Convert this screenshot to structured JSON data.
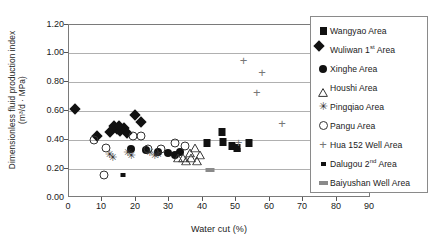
{
  "chart_data": {
    "type": "scatter",
    "title": "",
    "xlabel": "Water cut (%)",
    "ylabel_line1": "Dimensionless fluid production index",
    "ylabel_line2": "(m³/d · MPa)",
    "xlim": [
      0,
      90
    ],
    "ylim": [
      0.0,
      1.2
    ],
    "xticks": [
      "0",
      "10",
      "20",
      "30",
      "40",
      "50",
      "60",
      "70",
      "80",
      "90"
    ],
    "yticks": [
      "0.00",
      "0.20",
      "0.40",
      "0.60",
      "0.80",
      "1.00",
      "1.20"
    ],
    "grid": "horizontal",
    "legend_position": "right-inside",
    "series": [
      {
        "name": "Wangyao Area",
        "marker": "filled-square",
        "color": "#111111",
        "points": [
          [
            45.5,
            0.46
          ],
          [
            46.0,
            0.39
          ],
          [
            48.5,
            0.36
          ],
          [
            50.0,
            0.35
          ],
          [
            53.5,
            0.38
          ],
          [
            41.0,
            0.38
          ]
        ]
      },
      {
        "name": "Wuliwan 1st Area",
        "marker": "filled-diamond",
        "color": "#111111",
        "points": [
          [
            3.0,
            0.59
          ],
          [
            9.5,
            0.4
          ],
          [
            13.5,
            0.43
          ],
          [
            15.5,
            0.45
          ],
          [
            16.5,
            0.44
          ],
          [
            17.5,
            0.46
          ],
          [
            18.5,
            0.42
          ],
          [
            21.0,
            0.55
          ],
          [
            22.5,
            0.5
          ],
          [
            14.5,
            0.47
          ],
          [
            16.0,
            0.47
          ]
        ]
      },
      {
        "name": "Xinghe Area",
        "marker": "filled-circle",
        "color": "#111111",
        "points": [
          [
            18.5,
            0.34
          ],
          [
            23.0,
            0.33
          ],
          [
            26.5,
            0.32
          ],
          [
            29.5,
            0.31
          ],
          [
            31.5,
            0.3
          ],
          [
            33.0,
            0.32
          ]
        ]
      },
      {
        "name": "Houshi Area",
        "marker": "open-triangle",
        "color": "#333333",
        "points": [
          [
            34.0,
            0.31
          ],
          [
            35.0,
            0.29
          ],
          [
            36.0,
            0.35
          ],
          [
            36.5,
            0.31
          ],
          [
            37.5,
            0.38
          ],
          [
            38.0,
            0.29
          ],
          [
            39.0,
            0.33
          ],
          [
            32.5,
            0.31
          ]
        ]
      },
      {
        "name": "Pingqiao Area",
        "marker": "asterisk",
        "color": "#333333",
        "points": [
          [
            12.0,
            0.3
          ],
          [
            13.0,
            0.28
          ],
          [
            17.5,
            0.31
          ],
          [
            18.5,
            0.29
          ],
          [
            24.0,
            0.31
          ],
          [
            25.5,
            0.29
          ],
          [
            26.5,
            0.3
          ]
        ]
      },
      {
        "name": "Pangu Area",
        "marker": "open-circle",
        "color": "#333333",
        "points": [
          [
            7.5,
            0.4
          ],
          [
            11.0,
            0.35
          ],
          [
            19.0,
            0.43
          ],
          [
            21.5,
            0.43
          ],
          [
            23.5,
            0.34
          ],
          [
            27.5,
            0.34
          ],
          [
            31.5,
            0.38
          ],
          [
            34.5,
            0.36
          ],
          [
            10.5,
            0.16
          ]
        ]
      },
      {
        "name": "Hua 152 Well Area",
        "marker": "plus",
        "color": "#777777",
        "points": [
          [
            52.0,
            0.95
          ],
          [
            57.5,
            0.87
          ],
          [
            56.0,
            0.73
          ],
          [
            63.5,
            0.51
          ],
          [
            50.5,
            0.38
          ]
        ]
      },
      {
        "name": "Dalugou 2nd Area",
        "marker": "small-square",
        "color": "#111111",
        "points": [
          [
            16.0,
            0.16
          ],
          [
            50.5,
            0.33
          ]
        ]
      },
      {
        "name": "Baiyushan Well Area",
        "marker": "gray-bar",
        "color": "#8a8a8a",
        "points": [
          [
            42.0,
            0.195
          ]
        ]
      }
    ]
  },
  "legend": {
    "items": [
      {
        "label": "Wangyao Area",
        "marker": "filled-square-icon"
      },
      {
        "label": "Wuliwan 1",
        "sup": "st",
        "label2": " Area",
        "marker": "filled-diamond-icon"
      },
      {
        "label": "Xinghe Area",
        "marker": "filled-circle-icon"
      },
      {
        "label": "Houshi Area",
        "marker": "open-triangle-icon"
      },
      {
        "label": "Pingqiao Area",
        "marker": "asterisk-icon"
      },
      {
        "label": "Pangu Area",
        "marker": "open-circle-icon"
      },
      {
        "label": "Hua 152 Well Area",
        "marker": "plus-icon"
      },
      {
        "label": "Dalugou 2",
        "sup": "nd",
        "label2": " Area",
        "marker": "small-square-icon"
      },
      {
        "label": "Baiyushan Well Area",
        "marker": "gray-bar-icon"
      }
    ]
  }
}
